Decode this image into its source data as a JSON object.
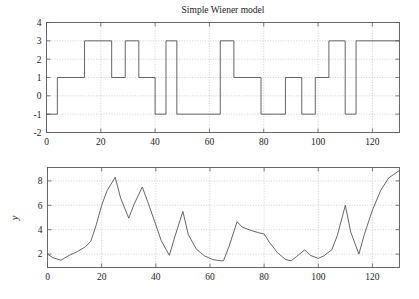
{
  "figure": {
    "title": "Simple Wiener model",
    "background_color": "#ffffff",
    "line_color": "#4a4a4a",
    "frame_color": "#5a5a5a",
    "grid_color": "#aaaaaa"
  },
  "chart_data": [
    {
      "type": "line",
      "id": "input-signal",
      "title": "Simple Wiener model",
      "xlabel": "",
      "ylabel": "",
      "xlim": [
        0,
        130
      ],
      "ylim": [
        -2,
        4
      ],
      "xticks": [
        0,
        20,
        40,
        60,
        80,
        100,
        120
      ],
      "yticks": [
        -2,
        -1,
        0,
        1,
        2,
        3,
        4
      ],
      "grid": true,
      "legend": null,
      "step": true,
      "x": [
        0,
        4,
        4,
        5,
        5,
        14,
        14,
        15,
        15,
        24,
        24,
        25,
        25,
        29,
        29,
        30,
        30,
        34,
        34,
        35,
        35,
        40,
        40,
        41,
        41,
        44,
        44,
        45,
        45,
        48,
        48,
        49,
        49,
        64,
        64,
        65,
        65,
        69,
        69,
        70,
        70,
        79,
        79,
        80,
        80,
        88,
        88,
        89,
        89,
        94,
        94,
        95,
        95,
        99,
        99,
        100,
        100,
        104,
        104,
        105,
        105,
        110,
        110,
        111,
        111,
        114,
        114,
        115,
        115,
        130
      ],
      "y": [
        -1,
        -1,
        1,
        1,
        1,
        1,
        3,
        3,
        3,
        3,
        1,
        1,
        1,
        1,
        3,
        3,
        3,
        3,
        1,
        1,
        1,
        1,
        -1,
        -1,
        -1,
        -1,
        3,
        3,
        3,
        3,
        -1,
        -1,
        -1,
        -1,
        3,
        3,
        3,
        3,
        1,
        1,
        1,
        1,
        -1,
        -1,
        -1,
        -1,
        1,
        1,
        1,
        1,
        -1,
        -1,
        -1,
        -1,
        1,
        1,
        1,
        1,
        3,
        3,
        3,
        3,
        -1,
        -1,
        -1,
        -1,
        3,
        3,
        3,
        3
      ]
    },
    {
      "type": "line",
      "id": "output-signal",
      "title": "",
      "xlabel": "",
      "ylabel": "y",
      "xlim": [
        0,
        130
      ],
      "ylim": [
        0.9,
        9.1
      ],
      "xticks": [
        0,
        20,
        40,
        60,
        80,
        100,
        120
      ],
      "yticks": [
        2,
        4,
        6,
        8
      ],
      "grid": true,
      "legend": null,
      "step": false,
      "x": [
        0,
        2,
        5,
        8,
        11,
        14,
        16,
        18,
        20,
        22,
        25,
        27,
        30,
        32,
        35,
        37,
        40,
        42,
        45,
        47,
        50,
        52,
        55,
        58,
        61,
        64,
        65,
        67,
        70,
        72,
        75,
        78,
        80,
        82,
        85,
        88,
        90,
        92,
        95,
        97,
        100,
        102,
        105,
        107,
        110,
        112,
        115,
        117,
        120,
        123,
        126,
        130
      ],
      "y": [
        2.0,
        1.7,
        1.5,
        1.9,
        2.2,
        2.6,
        3.05,
        4.4,
        6.0,
        7.2,
        8.3,
        6.6,
        4.95,
        6.1,
        7.5,
        6.3,
        4.4,
        3.1,
        1.9,
        3.4,
        5.5,
        3.6,
        2.4,
        1.85,
        1.55,
        1.45,
        1.45,
        2.6,
        4.65,
        4.2,
        3.95,
        3.75,
        3.65,
        2.95,
        2.1,
        1.55,
        1.45,
        1.8,
        2.35,
        1.9,
        1.65,
        1.85,
        2.35,
        3.5,
        6.0,
        3.8,
        2.0,
        3.6,
        5.6,
        7.2,
        8.25,
        8.85
      ]
    }
  ],
  "panels": {
    "top": {
      "name": "input-step-signal-plot",
      "title": "Simple Wiener model",
      "ytick_labels": [
        "4",
        "3",
        "2",
        "1",
        "0",
        "-1",
        "-2"
      ],
      "xtick_labels": [
        "0",
        "20",
        "40",
        "60",
        "80",
        "100",
        "120"
      ]
    },
    "bottom": {
      "name": "output-response-plot",
      "ylabel": "y",
      "ytick_labels": [
        "8",
        "6",
        "4",
        "2"
      ],
      "xtick_labels": [
        "0",
        "20",
        "40",
        "60",
        "80",
        "100",
        "120"
      ]
    }
  }
}
